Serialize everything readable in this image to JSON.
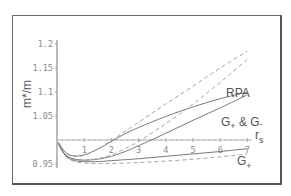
{
  "chart_data": {
    "type": "line",
    "title": "",
    "xlabel": "r_s",
    "ylabel": "m*/m",
    "xlim": [
      0,
      7.3
    ],
    "ylim": [
      0.94,
      1.21
    ],
    "x_ticks": [
      "1",
      "2",
      "3",
      "4",
      "5",
      "6",
      "7"
    ],
    "y_ticks": [
      "0.95",
      "1.05",
      "1.1",
      "1.15",
      "1.2"
    ],
    "grid": false,
    "legend": "inline labels",
    "annotations": [
      {
        "text": "RPA",
        "x": 6.2,
        "y": 1.11
      },
      {
        "text": "G+ & G-",
        "x": 6.1,
        "y": 1.03
      },
      {
        "text": "G+",
        "x": 6.5,
        "y": 0.93
      }
    ],
    "series": [
      {
        "name": "RPA (solid)",
        "style": "solid",
        "x": [
          0.05,
          0.3,
          0.6,
          1.0,
          1.5,
          2.0,
          2.5,
          3.0,
          4.0,
          5.0,
          6.0,
          7.0
        ],
        "y": [
          0.995,
          0.975,
          0.967,
          0.969,
          0.981,
          0.997,
          1.013,
          1.026,
          1.049,
          1.069,
          1.086,
          1.1
        ]
      },
      {
        "name": "RPA (dashed)",
        "style": "dashed",
        "x": [
          0.05,
          0.3,
          0.6,
          1.0,
          1.5,
          2.0,
          2.5,
          3.0,
          4.0,
          5.0,
          6.0,
          7.0
        ],
        "y": [
          0.995,
          0.974,
          0.966,
          0.968,
          0.981,
          0.999,
          1.018,
          1.037,
          1.075,
          1.112,
          1.15,
          1.185
        ]
      },
      {
        "name": "G+ & G- (solid)",
        "style": "solid",
        "x": [
          0.05,
          0.3,
          0.6,
          1.0,
          1.5,
          2.0,
          2.5,
          3.0,
          4.0,
          5.0,
          6.0,
          7.0
        ],
        "y": [
          0.993,
          0.97,
          0.961,
          0.958,
          0.96,
          0.966,
          0.976,
          0.988,
          1.014,
          1.041,
          1.067,
          1.094
        ]
      },
      {
        "name": "G+ & G- (dashed)",
        "style": "dashed",
        "x": [
          0.05,
          0.3,
          0.6,
          1.0,
          1.5,
          2.0,
          2.5,
          3.0,
          4.0,
          5.0,
          6.0,
          7.0
        ],
        "y": [
          0.993,
          0.969,
          0.96,
          0.958,
          0.961,
          0.969,
          0.982,
          0.997,
          1.034,
          1.075,
          1.12,
          1.168
        ]
      },
      {
        "name": "G+ (solid)",
        "style": "solid",
        "x": [
          0.05,
          0.3,
          0.6,
          1.0,
          1.5,
          2.0,
          3.0,
          4.0,
          5.0,
          6.0,
          7.0
        ],
        "y": [
          0.992,
          0.968,
          0.958,
          0.955,
          0.955,
          0.957,
          0.961,
          0.966,
          0.971,
          0.976,
          0.982
        ]
      },
      {
        "name": "G+ (dashed)",
        "style": "dashed",
        "x": [
          0.05,
          0.3,
          0.6,
          1.0,
          1.5,
          2.0,
          3.0,
          4.0,
          5.0,
          6.0,
          7.0
        ],
        "y": [
          0.992,
          0.967,
          0.956,
          0.952,
          0.951,
          0.951,
          0.953,
          0.956,
          0.96,
          0.965,
          0.971
        ]
      }
    ]
  },
  "labels": {
    "ylabel": "m*/m",
    "xlabel_main": "r",
    "xlabel_sub": "s",
    "rpa": "RPA",
    "gpg_main1": "G",
    "gpg_sub1": "+",
    "gpg_amp": " & G",
    "gpg_sub2": "-",
    "gp_main": "G",
    "gp_sub": "+"
  }
}
